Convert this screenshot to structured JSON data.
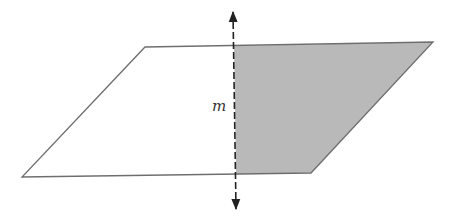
{
  "diagram": {
    "type": "geometry",
    "line_label": "m",
    "colors": {
      "outline": "#6e6e6e",
      "shade": "#b9b9b9",
      "axis": "#222222",
      "background": "#ffffff"
    },
    "parallelogram": {
      "vertices": [
        [
          145,
          47
        ],
        [
          433,
          42
        ],
        [
          311,
          173
        ],
        [
          22,
          177
        ]
      ]
    },
    "shaded_region": {
      "vertices": [
        [
          234,
          46
        ],
        [
          433,
          42
        ],
        [
          311,
          173
        ],
        [
          236,
          174
        ]
      ]
    },
    "line_m": {
      "start": [
        233,
        10
      ],
      "end": [
        236,
        211
      ],
      "style": "dashed",
      "arrows": "both"
    }
  }
}
